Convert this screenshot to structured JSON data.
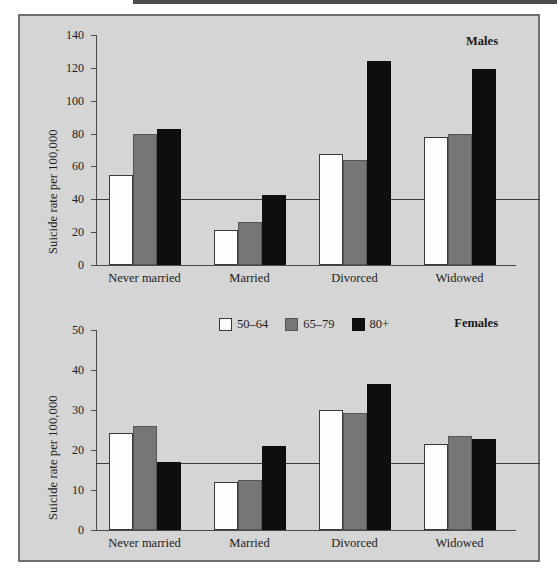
{
  "figure": {
    "panels": [
      {
        "id": "males",
        "label": "Males"
      },
      {
        "id": "females",
        "label": "Females"
      }
    ],
    "legend": [
      {
        "key": "50-64",
        "label": "50–64",
        "color": "#fdfdfd"
      },
      {
        "key": "65-79",
        "label": "65–79",
        "color": "#767676"
      },
      {
        "key": "80+",
        "label": "80+",
        "color": "#0e0e0e"
      }
    ]
  },
  "chart_data": [
    {
      "type": "bar",
      "title": "Males",
      "xlabel": "",
      "ylabel": "Suicide rate per 100,000",
      "categories": [
        "Never married",
        "Married",
        "Divorced",
        "Widowed"
      ],
      "series": [
        {
          "name": "50–64",
          "color": "#fdfdfd",
          "values": [
            55,
            21.5,
            67.5,
            78
          ]
        },
        {
          "name": "65–79",
          "color": "#767676",
          "values": [
            79.5,
            26,
            64,
            80
          ]
        },
        {
          "name": "80+",
          "color": "#0e0e0e",
          "values": [
            82.5,
            42.5,
            124,
            119.5
          ]
        }
      ],
      "ylim": [
        0,
        140
      ],
      "yticks": [
        0,
        20,
        40,
        60,
        80,
        100,
        120,
        140
      ],
      "ytick_labels": [
        "0",
        "20",
        "40",
        "60",
        "80",
        "100",
        "120",
        "140"
      ],
      "reference_line": 40,
      "grid": false,
      "legend_position": "below-panel"
    },
    {
      "type": "bar",
      "title": "Females",
      "xlabel": "",
      "ylabel": "Suicide rate per 100,000",
      "categories": [
        "Never married",
        "Married",
        "Divorced",
        "Widowed"
      ],
      "series": [
        {
          "name": "50–64",
          "color": "#fdfdfd",
          "values": [
            24.2,
            12,
            30,
            21.4
          ]
        },
        {
          "name": "65–79",
          "color": "#767676",
          "values": [
            26,
            12.4,
            29.3,
            23.5
          ]
        },
        {
          "name": "80+",
          "color": "#0e0e0e",
          "values": [
            17,
            21,
            36.5,
            22.7
          ]
        }
      ],
      "ylim": [
        0,
        50
      ],
      "yticks": [
        0,
        10,
        20,
        30,
        40,
        50
      ],
      "ytick_labels": [
        "0",
        "10",
        "20",
        "30",
        "40",
        "50"
      ],
      "reference_line": 16.7,
      "grid": false,
      "legend_position": "top-center"
    }
  ]
}
